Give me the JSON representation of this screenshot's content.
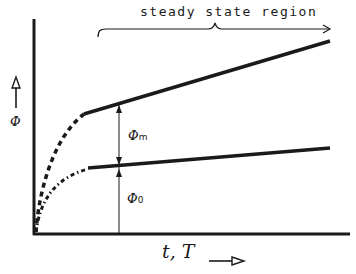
{
  "diagram": {
    "region_label": "steady state region",
    "y_axis_label": "Φ",
    "x_axis_label": "t, T",
    "annotations": {
      "phi_m": {
        "symbol": "Φ",
        "subscript": "m"
      },
      "phi_0": {
        "symbol": "Φ",
        "subscript": "0"
      }
    },
    "curves": [
      {
        "name": "upper",
        "transient_style": "dashed",
        "steady_style": "solid"
      },
      {
        "name": "lower",
        "transient_style": "dash-dot",
        "steady_style": "solid"
      }
    ],
    "colors": {
      "ink": "#1a1a1a",
      "background": "#ffffff"
    }
  }
}
